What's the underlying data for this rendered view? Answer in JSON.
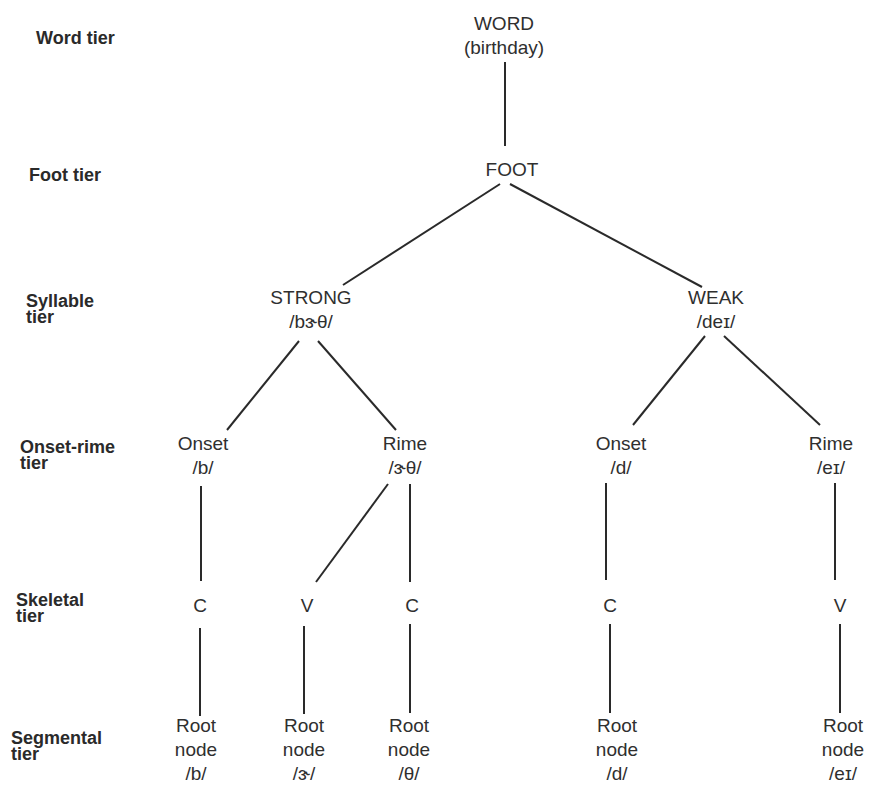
{
  "tiers": [
    {
      "id": "word",
      "line1": "Word tier",
      "line2": ""
    },
    {
      "id": "foot",
      "line1": "Foot tier",
      "line2": ""
    },
    {
      "id": "syllable",
      "line1": "Syllable",
      "line2": "tier"
    },
    {
      "id": "onset-rime",
      "line1": "Onset-rime",
      "line2": "tier"
    },
    {
      "id": "skeletal",
      "line1": "Skeletal",
      "line2": "tier"
    },
    {
      "id": "segmental",
      "line1": "Segmental",
      "line2": "tier"
    }
  ],
  "nodes": {
    "word": {
      "line1": "WORD",
      "line2": "(birthday)"
    },
    "foot": {
      "line1": "FOOT"
    },
    "strong": {
      "line1": "STRONG",
      "line2": "/bɝθ/"
    },
    "weak": {
      "line1": "WEAK",
      "line2": "/deɪ/"
    },
    "onset1": {
      "line1": "Onset",
      "line2": "/b/"
    },
    "rime1": {
      "line1": "Rime",
      "line2": "/ɝθ/"
    },
    "onset2": {
      "line1": "Onset",
      "line2": "/d/"
    },
    "rime2": {
      "line1": "Rime",
      "line2": "/eɪ/"
    },
    "c1": {
      "line1": "C"
    },
    "v1": {
      "line1": "V"
    },
    "c2": {
      "line1": "C"
    },
    "c3": {
      "line1": "C"
    },
    "v2": {
      "line1": "V"
    },
    "root1": {
      "line1": "Root",
      "line2": "node",
      "line3": "/b/"
    },
    "root2": {
      "line1": "Root",
      "line2": "node",
      "line3": "/ɝ/"
    },
    "root3": {
      "line1": "Root",
      "line2": "node",
      "line3": "/θ/"
    },
    "root4": {
      "line1": "Root",
      "line2": "node",
      "line3": "/d/"
    },
    "root5": {
      "line1": "Root",
      "line2": "node",
      "line3": "/eɪ/"
    }
  }
}
